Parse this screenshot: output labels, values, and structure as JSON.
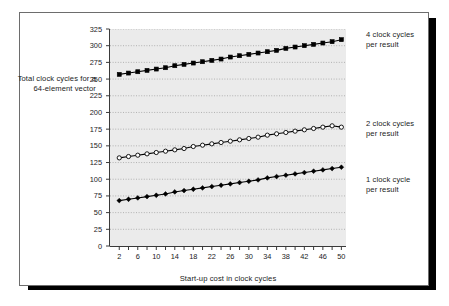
{
  "figure": {
    "y_axis_title": "Total clock cycles for a 64-element vector",
    "x_axis_title": "Start-up cost in clock cycles",
    "legend_4": "4 clock cycles\nper result",
    "legend_2": "2 clock cycles\nper result",
    "legend_1": "1 clock cycle\nper result",
    "colors": {
      "plot_background": "#ebebeb",
      "line": "#000000",
      "frame": "#6d6d6d",
      "shadow": "#000000",
      "text": "#1b1b1b",
      "gridline": "#9a9a9a"
    }
  },
  "chart_data": {
    "type": "line",
    "title": "",
    "xlabel": "Start-up cost in clock cycles",
    "ylabel": "Total clock cycles for a 64-element vector",
    "xlim": [
      0,
      51
    ],
    "ylim": [
      0,
      325
    ],
    "ytick_step": 25,
    "yticks": [
      0,
      25,
      50,
      75,
      100,
      125,
      150,
      175,
      200,
      225,
      250,
      275,
      300,
      325
    ],
    "xticks_labeled": [
      2,
      6,
      10,
      14,
      18,
      22,
      26,
      30,
      34,
      38,
      42,
      46,
      50
    ],
    "xticks_minor_step": 2,
    "grid": true,
    "legend_position": "right-of-plot",
    "x": [
      2,
      4,
      6,
      8,
      10,
      12,
      14,
      16,
      18,
      20,
      22,
      24,
      26,
      28,
      30,
      32,
      34,
      36,
      38,
      40,
      42,
      44,
      46,
      48,
      50
    ],
    "series": [
      {
        "name": "4 clock cycles per result",
        "marker": "filled-square",
        "values": [
          257,
          259,
          261,
          263,
          265,
          267,
          270,
          272,
          274,
          276,
          278,
          280,
          283,
          285,
          287,
          289,
          291,
          293,
          296,
          298,
          300,
          302,
          304,
          306,
          309
        ]
      },
      {
        "name": "2 clock cycles per result",
        "marker": "open-circle",
        "values": [
          132,
          134,
          136,
          138,
          140,
          142,
          144,
          146,
          149,
          151,
          153,
          155,
          157,
          159,
          161,
          163,
          166,
          168,
          170,
          172,
          174,
          176,
          178,
          180,
          178
        ]
      },
      {
        "name": "1 clock cycle per result",
        "marker": "filled-diamond",
        "values": [
          68,
          70,
          72,
          74,
          76,
          78,
          81,
          83,
          85,
          87,
          89,
          91,
          93,
          95,
          97,
          99,
          102,
          104,
          106,
          108,
          110,
          112,
          114,
          116,
          118
        ]
      }
    ]
  }
}
